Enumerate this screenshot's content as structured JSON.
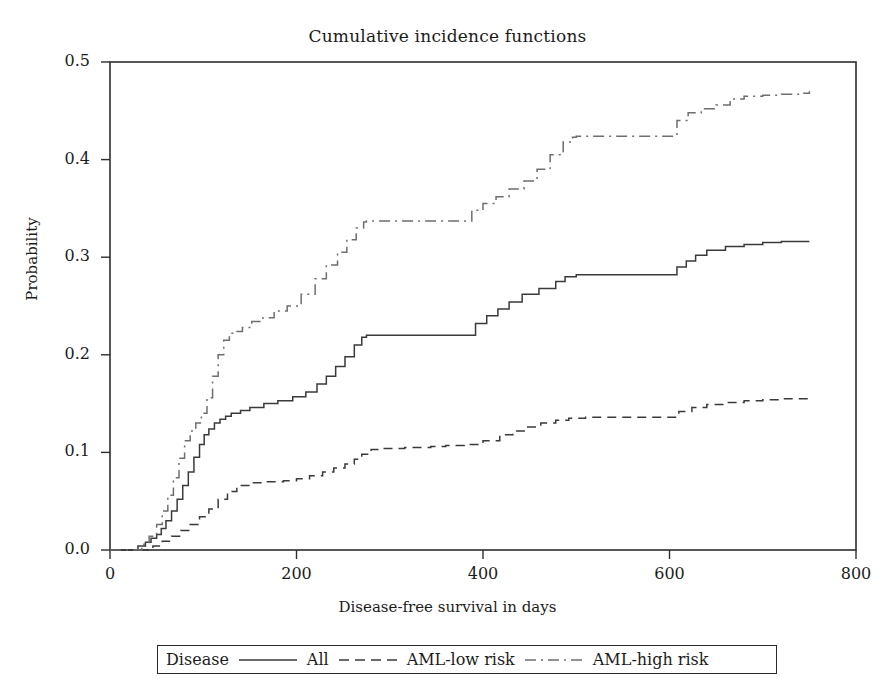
{
  "chart_data": {
    "type": "line",
    "title": "Cumulative incidence functions",
    "xlabel": "Disease-free survival in days",
    "ylabel": "Probability",
    "xlim": [
      0,
      800
    ],
    "ylim": [
      0.0,
      0.5
    ],
    "xticks": [
      "0",
      "200",
      "400",
      "600",
      "800"
    ],
    "xtick_values": [
      0,
      200,
      400,
      600,
      800
    ],
    "yticks": [
      "0.0",
      "0.1",
      "0.2",
      "0.3",
      "0.4",
      "0.5"
    ],
    "ytick_values": [
      0.0,
      0.1,
      0.2,
      0.3,
      0.4,
      0.5
    ],
    "grid": false,
    "legend_position": "below-plot",
    "legend_title": "Disease",
    "step_plot": true,
    "series": [
      {
        "name": "All",
        "linestyle": "solid",
        "color": "#3a3a3a",
        "x": [
          0,
          20,
          30,
          38,
          44,
          50,
          55,
          60,
          66,
          72,
          78,
          84,
          90,
          96,
          101,
          106,
          112,
          118,
          124,
          130,
          140,
          150,
          165,
          180,
          196,
          210,
          222,
          232,
          242,
          252,
          262,
          270,
          275,
          380,
          392,
          404,
          416,
          428,
          442,
          460,
          478,
          488,
          500,
          600,
          608,
          618,
          628,
          640,
          660,
          680,
          700,
          720,
          745,
          750
        ],
        "y": [
          0.0,
          0.0,
          0.004,
          0.008,
          0.012,
          0.016,
          0.022,
          0.03,
          0.04,
          0.052,
          0.066,
          0.08,
          0.095,
          0.108,
          0.118,
          0.124,
          0.13,
          0.134,
          0.137,
          0.14,
          0.143,
          0.146,
          0.15,
          0.153,
          0.157,
          0.162,
          0.17,
          0.178,
          0.188,
          0.198,
          0.21,
          0.218,
          0.22,
          0.22,
          0.232,
          0.24,
          0.247,
          0.254,
          0.262,
          0.268,
          0.275,
          0.28,
          0.282,
          0.282,
          0.29,
          0.296,
          0.302,
          0.307,
          0.311,
          0.313,
          0.315,
          0.316,
          0.316,
          0.316
        ]
      },
      {
        "name": "AML-low risk",
        "linestyle": "dashed",
        "color": "#3a3a3a",
        "x": [
          0,
          30,
          46,
          56,
          66,
          76,
          86,
          96,
          106,
          116,
          126,
          136,
          150,
          168,
          186,
          200,
          214,
          228,
          240,
          252,
          262,
          270,
          280,
          292,
          302,
          316,
          330,
          344,
          360,
          380,
          400,
          418,
          432,
          446,
          462,
          478,
          492,
          510,
          560,
          600,
          610,
          624,
          640,
          660,
          680,
          700,
          720,
          740,
          750
        ],
        "y": [
          0.0,
          0.0,
          0.004,
          0.009,
          0.014,
          0.02,
          0.026,
          0.034,
          0.042,
          0.052,
          0.06,
          0.066,
          0.069,
          0.07,
          0.071,
          0.073,
          0.076,
          0.08,
          0.084,
          0.088,
          0.093,
          0.098,
          0.103,
          0.104,
          0.104,
          0.105,
          0.105,
          0.106,
          0.107,
          0.108,
          0.112,
          0.118,
          0.122,
          0.126,
          0.13,
          0.133,
          0.135,
          0.136,
          0.136,
          0.136,
          0.142,
          0.146,
          0.149,
          0.151,
          0.153,
          0.154,
          0.155,
          0.155,
          0.155
        ]
      },
      {
        "name": "AML-high risk",
        "linestyle": "dashdot",
        "color": "#6e6e6e",
        "x": [
          0,
          22,
          34,
          42,
          50,
          56,
          62,
          68,
          74,
          80,
          86,
          92,
          98,
          104,
          110,
          116,
          122,
          128,
          134,
          142,
          152,
          164,
          176,
          190,
          205,
          220,
          232,
          244,
          254,
          264,
          272,
          275,
          378,
          388,
          400,
          414,
          428,
          444,
          458,
          472,
          486,
          496,
          500,
          600,
          608,
          620,
          634,
          650,
          665,
          680,
          700,
          720,
          740,
          750
        ],
        "y": [
          0.0,
          0.0,
          0.006,
          0.014,
          0.026,
          0.04,
          0.056,
          0.074,
          0.094,
          0.112,
          0.122,
          0.13,
          0.14,
          0.156,
          0.178,
          0.2,
          0.215,
          0.222,
          0.224,
          0.228,
          0.234,
          0.238,
          0.245,
          0.25,
          0.262,
          0.278,
          0.292,
          0.305,
          0.318,
          0.33,
          0.336,
          0.337,
          0.337,
          0.348,
          0.355,
          0.362,
          0.37,
          0.378,
          0.39,
          0.405,
          0.418,
          0.423,
          0.424,
          0.424,
          0.44,
          0.448,
          0.452,
          0.456,
          0.462,
          0.465,
          0.466,
          0.467,
          0.468,
          0.47
        ]
      }
    ]
  },
  "axes": {
    "frame_color": "#2e2e2e"
  }
}
